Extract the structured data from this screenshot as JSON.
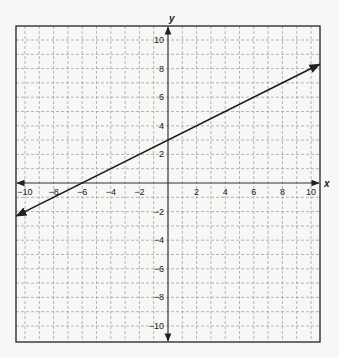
{
  "chart_data": {
    "type": "line",
    "title": "",
    "xlabel": "x",
    "ylabel": "y",
    "xlim": [
      -11,
      11
    ],
    "ylim": [
      -11,
      11
    ],
    "grid": true,
    "grid_style": "dashed",
    "grid_step": 1,
    "x_ticks": [
      -10,
      -8,
      -6,
      -4,
      -2,
      2,
      4,
      6,
      8,
      10
    ],
    "y_ticks": [
      10,
      8,
      6,
      4,
      2,
      -2,
      -4,
      -6,
      -8,
      -10
    ],
    "x_tick_labels": [
      "-10",
      "-8",
      "-6",
      "-4",
      "-2",
      "2",
      "4",
      "6",
      "8",
      "10"
    ],
    "y_tick_labels": [
      "10",
      "8",
      "6",
      "4",
      "2",
      "-2",
      "-4",
      "-6",
      "-8",
      "-10"
    ],
    "series": [
      {
        "name": "line",
        "equation": "y = 0.5x + 3",
        "slope": 0.5,
        "y_intercept": 3,
        "x_intercept": -6,
        "x": [
          -10.6,
          10.6
        ],
        "y": [
          -2.3,
          8.3
        ],
        "arrows": "both"
      }
    ],
    "legend": null
  },
  "colors": {
    "background": "#f7f7f5",
    "grid": "#9a9a9a",
    "axis": "#333333",
    "line": "#1a1a1a",
    "border": "#222222"
  },
  "layout": {
    "origin_px": [
      168,
      183
    ],
    "unit_px": 14.3,
    "box": {
      "left": 16,
      "top": 26,
      "right": 320,
      "bottom": 342
    }
  }
}
